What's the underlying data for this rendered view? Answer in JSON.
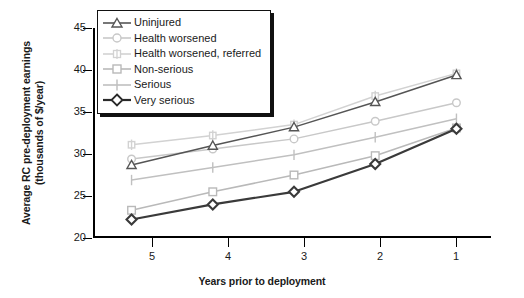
{
  "chart_data": {
    "type": "line",
    "title": "",
    "xlabel": "Years prior to deployment",
    "ylabel": "Average RC pre-deployment earnings\n(thousands of $/year)",
    "categories": [
      "5",
      "4",
      "3",
      "2",
      "1"
    ],
    "x": [
      5,
      4,
      3,
      2,
      1
    ],
    "xlim": [
      5.45,
      0.55
    ],
    "ylim": [
      20,
      45
    ],
    "yticks": [
      20,
      25,
      30,
      35,
      40,
      45
    ],
    "xticks": [
      "5",
      "4",
      "3",
      "2",
      "1"
    ],
    "grid": false,
    "legend_position": "top-left-inside",
    "series": [
      {
        "name": "Uninjured",
        "marker": "triangle",
        "color": "#555555",
        "values": [
          28.7,
          31.0,
          33.2,
          36.2,
          39.4
        ]
      },
      {
        "name": "Health worsened",
        "marker": "circle",
        "color": "#c8c8c8",
        "values": [
          29.4,
          30.6,
          31.8,
          33.9,
          36.1
        ]
      },
      {
        "name": "Health worsened, referred",
        "marker": "plus-box",
        "color": "#d2d2d2",
        "values": [
          31.1,
          32.2,
          33.5,
          36.9,
          39.6
        ]
      },
      {
        "name": "Non-serious",
        "marker": "square",
        "color": "#b9b9b9",
        "values": [
          23.3,
          25.5,
          27.5,
          29.8,
          33.1
        ]
      },
      {
        "name": "Serious",
        "marker": "plus",
        "color": "#c0c0c0",
        "values": [
          26.9,
          28.4,
          29.9,
          32.0,
          34.2
        ]
      },
      {
        "name": "Very serious",
        "marker": "diamond",
        "color": "#3a3a3a",
        "values": [
          22.2,
          24.0,
          25.5,
          28.8,
          33.0
        ]
      }
    ]
  },
  "axes": {
    "y_title": "Average RC pre-deployment earnings\n(thousands of $/year)",
    "x_title": "Years prior to deployment",
    "y_tick_labels": [
      "45",
      "40",
      "35",
      "30",
      "25",
      "20"
    ],
    "x_tick_labels": [
      "5",
      "4",
      "3",
      "2",
      "1"
    ]
  },
  "legend": {
    "items": [
      {
        "label": "Uninjured"
      },
      {
        "label": "Health worsened"
      },
      {
        "label": "Health worsened, referred"
      },
      {
        "label": "Non-serious"
      },
      {
        "label": "Serious"
      },
      {
        "label": "Very serious"
      }
    ]
  }
}
